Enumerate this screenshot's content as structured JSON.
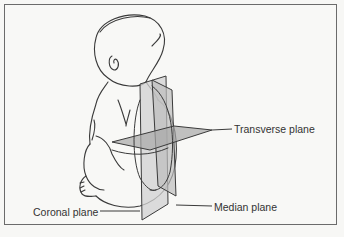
{
  "figure": {
    "labels": {
      "transverse": "Transverse plane",
      "median": "Median plane",
      "coronal": "Coronal plane"
    },
    "colors": {
      "line": "#3a3a3a",
      "plane_fill": "#c9c9c9",
      "plane_fill_dark": "#a9a9a9",
      "background": "#f8f8f6",
      "frame": "#6b6b6b"
    }
  }
}
